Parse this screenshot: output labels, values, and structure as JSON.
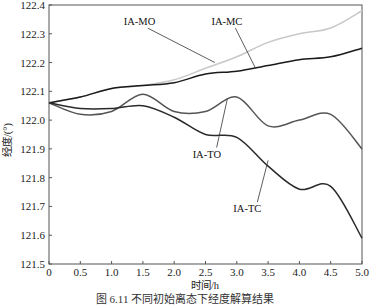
{
  "chart_data": {
    "type": "line",
    "title": "",
    "xlabel": "时间/h",
    "ylabel": "经度/(°)",
    "xlim": [
      0,
      5.0
    ],
    "ylim": [
      121.5,
      122.4
    ],
    "x_ticks": [
      "0",
      "0.5",
      "1.0",
      "1.5",
      "2.0",
      "2.5",
      "3.0",
      "3.5",
      "4.0",
      "4.5",
      "5.0"
    ],
    "y_ticks": [
      "121.5",
      "121.6",
      "121.7",
      "121.8",
      "121.9",
      "122.0",
      "122.1",
      "122.2",
      "122.3",
      "122.4"
    ],
    "grid": false,
    "legend": "inline labels with leader lines",
    "x": [
      0,
      0.5,
      1.0,
      1.5,
      2.0,
      2.5,
      3.0,
      3.5,
      4.0,
      4.5,
      5.0
    ],
    "series": [
      {
        "name": "IA-MO",
        "color": "#c8c8c8",
        "values": [
          122.06,
          122.08,
          122.11,
          122.12,
          122.14,
          122.18,
          122.22,
          122.27,
          122.3,
          122.32,
          122.38
        ]
      },
      {
        "name": "IA-MC",
        "color": "#1a1a1a",
        "values": [
          122.06,
          122.08,
          122.11,
          122.12,
          122.13,
          122.16,
          122.17,
          122.19,
          122.21,
          122.22,
          122.25
        ]
      },
      {
        "name": "IA-TO",
        "color": "#555555",
        "values": [
          122.06,
          122.02,
          122.03,
          122.09,
          122.03,
          122.03,
          122.08,
          121.98,
          122.0,
          122.02,
          121.9
        ]
      },
      {
        "name": "IA-TC",
        "color": "#2a2a2a",
        "values": [
          122.06,
          122.04,
          122.04,
          122.05,
          122.01,
          121.95,
          121.94,
          121.84,
          121.76,
          121.77,
          121.59
        ]
      }
    ],
    "annotations": [
      {
        "text": "IA-MO",
        "label_x": 1.45,
        "label_y": 122.33,
        "target_x": 2.65,
        "target_y": 122.2
      },
      {
        "text": "IA-MC",
        "label_x": 2.85,
        "label_y": 122.33,
        "target_x": 3.3,
        "target_y": 122.18
      },
      {
        "text": "IA-TO",
        "label_x": 2.55,
        "label_y": 121.87,
        "target_x": 2.85,
        "target_y": 122.075
      },
      {
        "text": "IA-TC",
        "label_x": 3.2,
        "label_y": 121.68,
        "target_x": 3.5,
        "target_y": 121.86
      }
    ]
  },
  "caption": "图 6.11  不同初始离态下经度解算结果"
}
